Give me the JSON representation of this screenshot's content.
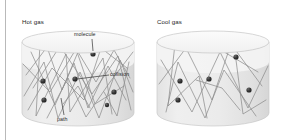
{
  "figure": {
    "type": "physics-diagram",
    "panels": [
      {
        "id": "hot",
        "title": "Hot gas",
        "molecule_count": 6,
        "description": "Short, frequent zig-zag paths with many collisions"
      },
      {
        "id": "cool",
        "title": "Cool gas",
        "molecule_count": 5,
        "description": "Long, infrequent zig-zag paths with few collisions"
      }
    ],
    "callouts": [
      {
        "id": "molecule",
        "label": "molecule"
      },
      {
        "id": "collision",
        "label": "collision"
      },
      {
        "id": "path",
        "label": "path"
      }
    ],
    "colors": {
      "background": "#ffffff",
      "cylinder_top": "#f6f6f6",
      "cylinder_body": "#ececec",
      "cylinder_outline": "#c9c9c9",
      "path_stroke": "#8e8e8e",
      "molecule_fill": "#2b2b2b",
      "leader_line": "#333333",
      "text": "#1b1b1b",
      "gutter_rule": "#b9b9b9"
    }
  }
}
